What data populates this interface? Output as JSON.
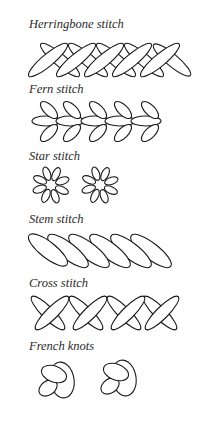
{
  "sections": [
    {
      "id": "herringbone",
      "label": "Herringbone stitch"
    },
    {
      "id": "fern",
      "label": "Fern stitch"
    },
    {
      "id": "star",
      "label": "Star stitch"
    },
    {
      "id": "stem",
      "label": "Stem stitch"
    },
    {
      "id": "cross",
      "label": "Cross stitch"
    },
    {
      "id": "french",
      "label": "French knots"
    }
  ],
  "colors": {
    "background": "#ffffff",
    "stroke": "#1a1a1a",
    "text": "#2a2a2a"
  }
}
